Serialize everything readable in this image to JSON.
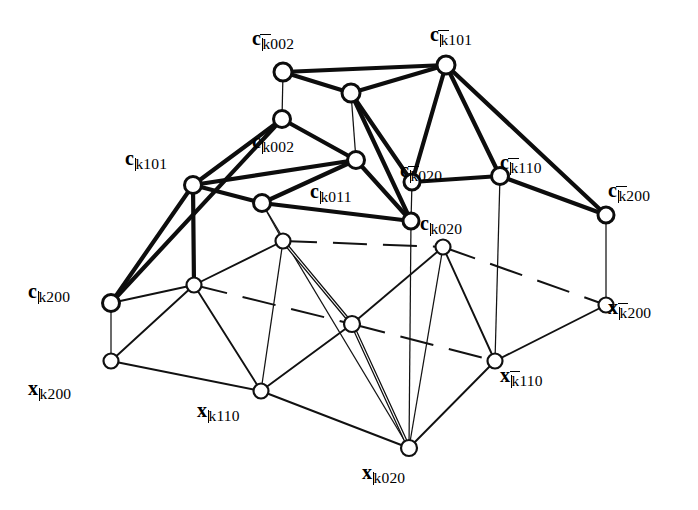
{
  "figure": {
    "kind": "mathematical-graph-diagram",
    "background_color": "#ffffff",
    "ink_color": "#0d0d0d",
    "width": 698,
    "height": 510
  },
  "labels": [
    {
      "id": "c-kbar002",
      "symbol": "c",
      "bar": true,
      "index": "002",
      "text": "c002",
      "x": 252,
      "y": 28,
      "anchor": "start"
    },
    {
      "id": "c-kbar101",
      "symbol": "c",
      "bar": true,
      "index": "101",
      "text": "c101",
      "x": 430,
      "y": 24,
      "anchor": "start"
    },
    {
      "id": "c-k002",
      "symbol": "c",
      "bar": false,
      "index": "002",
      "text": "c002",
      "x": 252,
      "y": 131,
      "anchor": "start"
    },
    {
      "id": "c-k101",
      "symbol": "c",
      "bar": false,
      "index": "101",
      "text": "c101",
      "x": 125,
      "y": 148,
      "anchor": "start"
    },
    {
      "id": "c-kbar020",
      "symbol": "c",
      "bar": true,
      "index": "020",
      "text": "c020",
      "x": 400,
      "y": 160,
      "anchor": "start"
    },
    {
      "id": "c-kbar110",
      "symbol": "c",
      "bar": true,
      "index": "110",
      "text": "c110",
      "x": 500,
      "y": 152,
      "anchor": "start"
    },
    {
      "id": "c-k011",
      "symbol": "c",
      "bar": false,
      "index": "011",
      "text": "c011",
      "x": 310,
      "y": 181,
      "anchor": "start"
    },
    {
      "id": "c-kbar200",
      "symbol": "c",
      "bar": true,
      "index": "200",
      "text": "c200",
      "x": 608,
      "y": 180,
      "anchor": "start"
    },
    {
      "id": "c-k020",
      "symbol": "c",
      "bar": false,
      "index": "020",
      "text": "c020",
      "x": 420,
      "y": 213,
      "anchor": "start"
    },
    {
      "id": "c-k200",
      "symbol": "c",
      "bar": false,
      "index": "200",
      "text": "c200",
      "x": 28,
      "y": 281,
      "anchor": "start"
    },
    {
      "id": "x-kbar200",
      "symbol": "x",
      "bar": true,
      "index": "200",
      "text": "x200",
      "x": 608,
      "y": 297,
      "anchor": "start"
    },
    {
      "id": "x-k200",
      "symbol": "x",
      "bar": false,
      "index": "200",
      "text": "x200",
      "x": 28,
      "y": 378,
      "anchor": "start"
    },
    {
      "id": "x-kbar110",
      "symbol": "x",
      "bar": true,
      "index": "110",
      "text": "x110",
      "x": 500,
      "y": 365,
      "anchor": "start"
    },
    {
      "id": "x-k110",
      "symbol": "x",
      "bar": false,
      "index": "110",
      "text": "x110",
      "x": 197,
      "y": 400,
      "anchor": "start"
    },
    {
      "id": "x-k020",
      "symbol": "x",
      "bar": false,
      "index": "020",
      "text": "x020",
      "x": 362,
      "y": 462,
      "anchor": "start"
    }
  ],
  "nodes": [
    {
      "id": "n-c-kbar002",
      "x": 283,
      "y": 72,
      "r": 9,
      "layer": "c",
      "label": "c-kbar002"
    },
    {
      "id": "n-c-kbar101",
      "x": 446,
      "y": 65,
      "r": 9,
      "layer": "c",
      "label": "c-kbar101"
    },
    {
      "id": "n-ta",
      "x": 351,
      "y": 93,
      "r": 9,
      "layer": "c",
      "label": ""
    },
    {
      "id": "n-c-k002",
      "x": 282,
      "y": 119,
      "r": 8.5,
      "layer": "c",
      "label": "c-k002"
    },
    {
      "id": "n-tb",
      "x": 356,
      "y": 160,
      "r": 8.5,
      "layer": "c",
      "label": ""
    },
    {
      "id": "n-c-k101",
      "x": 193,
      "y": 185,
      "r": 8.5,
      "layer": "c",
      "label": "c-k101"
    },
    {
      "id": "n-c-kbar020",
      "x": 412,
      "y": 182,
      "r": 8,
      "layer": "c",
      "label": "c-kbar020"
    },
    {
      "id": "n-c-kbar110",
      "x": 500,
      "y": 176,
      "r": 8.5,
      "layer": "c",
      "label": "c-kbar110"
    },
    {
      "id": "n-c-k011",
      "x": 262,
      "y": 203,
      "r": 8.5,
      "layer": "c",
      "label": "c-k011"
    },
    {
      "id": "n-c-kbar200",
      "x": 606,
      "y": 215,
      "r": 8,
      "layer": "c",
      "label": "c-kbar200"
    },
    {
      "id": "n-c-k020",
      "x": 411,
      "y": 221,
      "r": 8,
      "layer": "c",
      "label": "c-k020"
    },
    {
      "id": "n-c-k200",
      "x": 111,
      "y": 303,
      "r": 8.5,
      "layer": "c",
      "label": "c-k200"
    },
    {
      "id": "n-xa",
      "x": 283,
      "y": 241,
      "r": 7.5,
      "layer": "x",
      "label": ""
    },
    {
      "id": "n-xb",
      "x": 443,
      "y": 247,
      "r": 7.5,
      "layer": "x",
      "label": ""
    },
    {
      "id": "n-x-kbar200",
      "x": 606,
      "y": 305,
      "r": 7.5,
      "layer": "x",
      "label": "x-kbar200"
    },
    {
      "id": "n-xc",
      "x": 194,
      "y": 285,
      "r": 7.5,
      "layer": "x",
      "label": ""
    },
    {
      "id": "n-xmid",
      "x": 352,
      "y": 324,
      "r": 8,
      "layer": "x",
      "label": ""
    },
    {
      "id": "n-x-k200",
      "x": 111,
      "y": 361,
      "r": 7.5,
      "layer": "x",
      "label": "x-k200"
    },
    {
      "id": "n-x-kbar110",
      "x": 495,
      "y": 361,
      "r": 7.5,
      "layer": "x",
      "label": "x-kbar110"
    },
    {
      "id": "n-x-k110",
      "x": 261,
      "y": 391,
      "r": 7.5,
      "layer": "x",
      "label": "x-k110"
    },
    {
      "id": "n-x-k020",
      "x": 409,
      "y": 448,
      "r": 8,
      "layer": "x",
      "label": "x-k020"
    }
  ],
  "edges": [
    {
      "from": "n-c-kbar002",
      "to": "n-c-kbar101",
      "style": "thick"
    },
    {
      "from": "n-c-kbar002",
      "to": "n-ta",
      "style": "thick"
    },
    {
      "from": "n-ta",
      "to": "n-c-kbar101",
      "style": "thick"
    },
    {
      "from": "n-c-kbar002",
      "to": "n-c-k002",
      "style": "hair"
    },
    {
      "from": "n-ta",
      "to": "n-tb",
      "style": "hair"
    },
    {
      "from": "n-c-k002",
      "to": "n-tb",
      "style": "thick"
    },
    {
      "from": "n-c-k002",
      "to": "n-c-k101",
      "style": "thick"
    },
    {
      "from": "n-c-k101",
      "to": "n-tb",
      "style": "thick"
    },
    {
      "from": "n-ta",
      "to": "n-c-kbar020",
      "style": "thick"
    },
    {
      "from": "n-ta",
      "to": "n-c-k020",
      "style": "thick"
    },
    {
      "from": "n-c-kbar101",
      "to": "n-c-kbar020",
      "style": "thick"
    },
    {
      "from": "n-c-kbar101",
      "to": "n-c-kbar110",
      "style": "thick"
    },
    {
      "from": "n-c-kbar101",
      "to": "n-c-kbar200",
      "style": "thick"
    },
    {
      "from": "n-c-kbar020",
      "to": "n-c-kbar110",
      "style": "thick"
    },
    {
      "from": "n-c-kbar020",
      "to": "n-c-k020",
      "style": "hair"
    },
    {
      "from": "n-c-kbar110",
      "to": "n-c-kbar200",
      "style": "thick"
    },
    {
      "from": "n-c-kbar110",
      "to": "n-x-kbar110",
      "style": "hair"
    },
    {
      "from": "n-c-kbar200",
      "to": "n-x-kbar200",
      "style": "hair"
    },
    {
      "from": "n-tb",
      "to": "n-c-k011",
      "style": "thick"
    },
    {
      "from": "n-tb",
      "to": "n-c-k020",
      "style": "thick"
    },
    {
      "from": "n-c-k101",
      "to": "n-c-k011",
      "style": "thick"
    },
    {
      "from": "n-c-k011",
      "to": "n-c-k020",
      "style": "thick"
    },
    {
      "from": "n-c-k011",
      "to": "n-x-k020",
      "style": "hair"
    },
    {
      "from": "n-c-k101",
      "to": "n-c-k200",
      "style": "thick"
    },
    {
      "from": "n-c-k101",
      "to": "n-xc",
      "style": "thick"
    },
    {
      "from": "n-c-k002",
      "to": "n-c-k200",
      "style": "thick"
    },
    {
      "from": "n-c-k200",
      "to": "n-x-k200",
      "style": "hair"
    },
    {
      "from": "n-c-k020",
      "to": "n-x-k020",
      "style": "hair"
    },
    {
      "from": "n-c-k011",
      "to": "n-xa",
      "style": "hair"
    },
    {
      "from": "n-xa",
      "to": "n-xb",
      "style": "dashed"
    },
    {
      "from": "n-xb",
      "to": "n-x-kbar200",
      "style": "dashed"
    },
    {
      "from": "n-xc",
      "to": "n-xmid",
      "style": "dashed"
    },
    {
      "from": "n-xmid",
      "to": "n-x-kbar110",
      "style": "dashed"
    },
    {
      "from": "n-c-k200",
      "to": "n-xc",
      "style": "thin"
    },
    {
      "from": "n-xc",
      "to": "n-x-k200",
      "style": "thin"
    },
    {
      "from": "n-xc",
      "to": "n-x-k110",
      "style": "thin"
    },
    {
      "from": "n-xc",
      "to": "n-xa",
      "style": "thin"
    },
    {
      "from": "n-x-k200",
      "to": "n-x-k110",
      "style": "thin"
    },
    {
      "from": "n-x-k110",
      "to": "n-xmid",
      "style": "thin"
    },
    {
      "from": "n-x-k110",
      "to": "n-x-k020",
      "style": "thin"
    },
    {
      "from": "n-xmid",
      "to": "n-x-k020",
      "style": "double"
    },
    {
      "from": "n-xa",
      "to": "n-xmid",
      "style": "double"
    },
    {
      "from": "n-xmid",
      "to": "n-xb",
      "style": "thin"
    },
    {
      "from": "n-xb",
      "to": "n-x-kbar110",
      "style": "thin"
    },
    {
      "from": "n-x-kbar110",
      "to": "n-x-k020",
      "style": "thin"
    },
    {
      "from": "n-x-kbar110",
      "to": "n-x-kbar200",
      "style": "thin"
    },
    {
      "from": "n-xa",
      "to": "n-x-k110",
      "style": "hair"
    },
    {
      "from": "n-xb",
      "to": "n-x-k020",
      "style": "hair"
    }
  ]
}
